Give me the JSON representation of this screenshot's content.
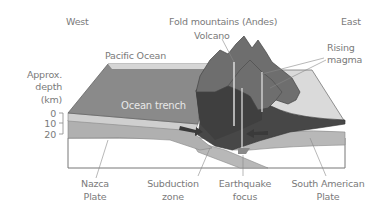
{
  "diagram": {
    "compass": {
      "west": "West",
      "east": "East"
    },
    "labels": {
      "fold_mountains": "Fold mountains (Andes)",
      "volcano": "Volcano",
      "rising_magma_1": "Rising",
      "rising_magma_2": "magma",
      "pacific_ocean": "Pacific Ocean",
      "ocean_trench": "Ocean trench",
      "depth_1": "Approx.",
      "depth_2": "depth",
      "depth_3": "(km)",
      "nazca_1": "Nazca",
      "nazca_2": "Plate",
      "subduction_1": "Subduction",
      "subduction_2": "zone",
      "earthquake_1": "Earthquake",
      "earthquake_2": "focus",
      "south_american_1": "South American",
      "south_american_2": "Plate"
    },
    "depth_scale": {
      "ticks": [
        "0",
        "10",
        "20"
      ],
      "unit": "km"
    },
    "colors": {
      "ocean": "#8c8c8c",
      "ocean_rim": "#d4d4d4",
      "plate": "#b4b4b4",
      "mantle": "#ffffff",
      "continent_dark": "#4a4a4a",
      "mountain": "#6e6e6e",
      "land_light": "#d9d9d9",
      "label": "#7a7a7a"
    }
  }
}
